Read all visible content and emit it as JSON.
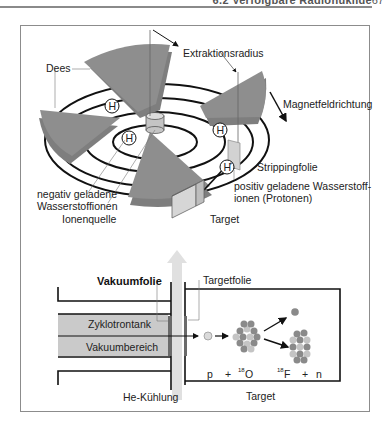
{
  "header": {
    "section_title": "6.2 Verfolgbare Radionuklide",
    "page_number": "67"
  },
  "diagram_top": {
    "labels": {
      "extraction_radius": "Extraktionsradius",
      "dees": "Dees",
      "magnetic_field": "Magnetfeldrichtung",
      "stripping_foil": "Strippingfolie",
      "positive_ions_line1": "positiv geladene Wasserstoff-",
      "positive_ions_line2": "ionen (Protonen)",
      "negative_ions_line1": "negativ geladene",
      "negative_ions_line2": "Wasserstoffionen",
      "ion_source": "Ionenquelle",
      "target": "Target"
    },
    "ion_markers": {
      "negative": "H",
      "negative_sup": "−",
      "positive": "H",
      "positive_sup": "+"
    }
  },
  "diagram_bottom": {
    "labels": {
      "vacuum_foil": "Vakuumfolie",
      "target_foil": "Targetfolie",
      "cyclotron_tank": "Zyklotrontank",
      "vacuum_region": "Vakuumbereich",
      "he_cooling": "He-Kühlung",
      "target": "Target"
    },
    "reaction": {
      "p": "p",
      "plus1": "+",
      "o_mass": "18",
      "o": "O",
      "f_mass": "18",
      "f": "F",
      "plus2": "+",
      "n": "n"
    }
  },
  "colors": {
    "dee_gray": "#8e8e8e",
    "dee_dark": "#7a7a7a",
    "light_gray": "#cfcfcf",
    "tank_fill": "#c8c8c8",
    "frame": "#8c8c8c",
    "line": "#111111"
  }
}
